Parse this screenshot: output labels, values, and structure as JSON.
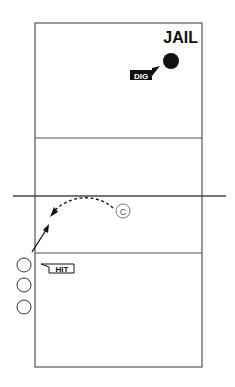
{
  "diagram": {
    "title": "JAIL",
    "labels": {
      "dig": "DIG",
      "hit": "HIT",
      "coach": "C"
    },
    "court": {
      "left": 35,
      "right": 202,
      "top": 23,
      "bottom": 367,
      "attack_line_top": 138,
      "attack_line_bottom": 253,
      "net_y": 196,
      "net_x1": 13,
      "net_x2": 226
    },
    "ball": {
      "x": 171,
      "y": 61,
      "r": 8,
      "color": "#111111"
    },
    "coach": {
      "x": 123,
      "y": 211,
      "r": 7
    },
    "players": [
      {
        "x": 24,
        "y": 265,
        "r": 7
      },
      {
        "x": 24,
        "y": 285,
        "r": 7
      },
      {
        "x": 24,
        "y": 307,
        "r": 7
      }
    ],
    "colors": {
      "line": "#555555",
      "ink": "#111111",
      "label_bg": "#111111",
      "label_fg": "#ffffff"
    }
  }
}
